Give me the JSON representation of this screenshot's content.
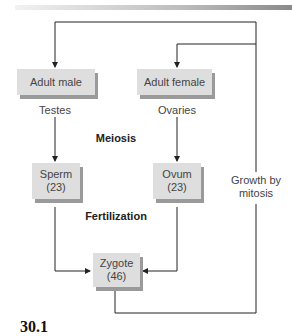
{
  "diagram": {
    "nodes": {
      "adult_male": "Adult male",
      "adult_female": "Adult female",
      "sperm": {
        "line1": "Sperm",
        "line2": "(23)"
      },
      "ovum": {
        "line1": "Ovum",
        "line2": "(23)"
      },
      "zygote": {
        "line1": "Zygote",
        "line2": "(46)"
      }
    },
    "labels": {
      "testes": "Testes",
      "ovaries": "Ovaries",
      "meiosis": "Meiosis",
      "fertilization": "Fertilization",
      "growth_line1": "Growth by",
      "growth_line2": "mitosis"
    },
    "figure_number": "30.1",
    "colors": {
      "box_fill": "#dedede",
      "box_shadow": "#9a9a9a",
      "line": "#222222"
    }
  }
}
